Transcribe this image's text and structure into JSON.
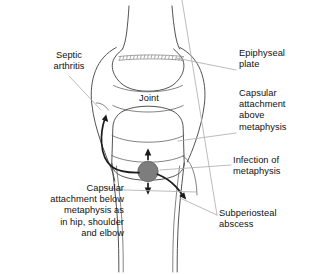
{
  "figure": {
    "background_color": "#ffffff",
    "line_color": "#3f3f3f",
    "leader_color": "#b0b0b0",
    "arrow_color": "#1b1b1b",
    "infection_color": "#7d7d7d"
  },
  "labels": {
    "septic_arthritis": "Septic\narthritis",
    "joint": "Joint",
    "epiphyseal_plate": "Epiphyseal\nplate",
    "capsular_attachment_above": "Capsular\nattachment\nabove\nmetaphysis",
    "infection_of_metaphysis": "Infection of\nmetaphysis",
    "subperiosteal_abscess": "Subperiosteal\nabscess",
    "capsular_attachment_below": "Capsular\nattachment below\nmetaphysis as\nin hip, shoulder\nand elbow"
  },
  "icons": {
    "infection_focus": "infection-focus-circle",
    "spread_up_arrow": "spread-up-arrow",
    "spread_down_arrow": "spread-down-arrow",
    "spread_joint_arrow": "spread-to-joint-arrow",
    "spread_subperiosteal_arrow": "spread-subperiosteal-arrow",
    "growth_plate": "epiphyseal-plate-hatching"
  }
}
